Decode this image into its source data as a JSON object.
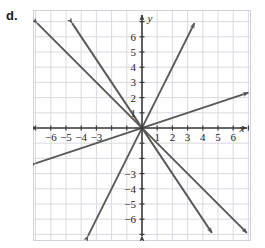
{
  "part_label": "d.",
  "colors": {
    "grid": "#d9d9e2",
    "border": "#d2d2da",
    "axis": "#3b3b3b",
    "line": "#595959",
    "label": "#262626",
    "background": "#ffffff"
  },
  "chart_data": {
    "type": "line",
    "title": "",
    "subtitle": "",
    "xlabel": "x",
    "ylabel": "y",
    "xlim": [
      -7.2,
      7.2
    ],
    "ylim": [
      -7.4,
      7.2
    ],
    "grid": true,
    "grid_step": 1,
    "legend": "none",
    "axes_style": "double-arrow",
    "x_ticks": [
      -6,
      -5,
      -4,
      -3,
      1,
      2,
      3,
      4,
      5,
      6
    ],
    "x_tick_labels": [
      "−6",
      "−5",
      "−4",
      "−3",
      "1",
      "2",
      "3",
      "4",
      "5",
      "6"
    ],
    "y_ticks": [
      6,
      5,
      4,
      3,
      2,
      1,
      -3,
      -4,
      -5,
      -6
    ],
    "y_tick_labels": [
      "6",
      "5",
      "4",
      "3",
      "2",
      "1",
      "−3",
      "−4",
      "−5",
      "−6"
    ],
    "series": [
      {
        "name": "line-slope-2",
        "slope": 2,
        "intercept": 0,
        "equation": "y = 2x",
        "x": [
          -3.55,
          3.45
        ],
        "y": [
          -7.1,
          6.9
        ],
        "arrows": "both"
      },
      {
        "name": "line-slope-one-third",
        "slope": 0.3333,
        "intercept": 0,
        "equation": "y = (1/3)x",
        "x": [
          -7.0,
          7.0
        ],
        "y": [
          -2.33,
          2.33
        ],
        "arrows": "both"
      },
      {
        "name": "line-slope-negative-one",
        "slope": -1,
        "intercept": 0,
        "equation": "y = −x",
        "x": [
          -6.9,
          6.9
        ],
        "y": [
          6.9,
          -6.9
        ],
        "arrows": "both"
      },
      {
        "name": "line-slope-negative-one-point-five",
        "slope": -1.5,
        "intercept": 0,
        "equation": "y = −1.5x",
        "x": [
          -4.6,
          4.6
        ],
        "y": [
          6.9,
          -6.9
        ],
        "arrows": "both"
      }
    ]
  }
}
